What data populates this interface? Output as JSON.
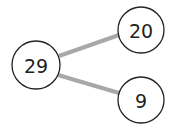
{
  "diagram": {
    "type": "tree",
    "edge_color": "#a8a8a8",
    "nodes": [
      {
        "id": "root",
        "label": "29",
        "cx": 36,
        "cy": 65,
        "r": 24
      },
      {
        "id": "child-top",
        "label": "20",
        "cx": 141,
        "cy": 30,
        "r": 23
      },
      {
        "id": "child-bottom",
        "label": "9",
        "cx": 141,
        "cy": 100,
        "r": 23
      }
    ],
    "edges": [
      {
        "from": "root",
        "to": "child-top"
      },
      {
        "from": "root",
        "to": "child-bottom"
      }
    ]
  }
}
